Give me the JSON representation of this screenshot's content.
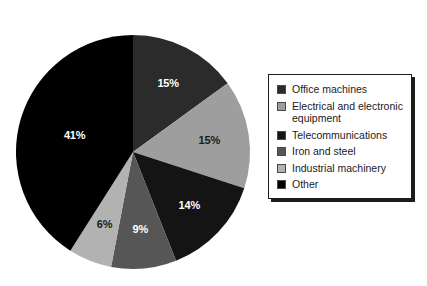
{
  "chart_data": {
    "type": "pie",
    "title": "",
    "subtitle": "",
    "xlabel": "",
    "ylabel": "",
    "grid": false,
    "legend_position": "right",
    "start_angle_deg": 0,
    "direction": "clockwise",
    "units": "%",
    "categories": [
      "Office machines",
      "Electrical and electronic equipment",
      "Telecommunications",
      "Iron and steel",
      "Industrial machinery",
      "Other"
    ],
    "values": [
      15,
      15,
      14,
      9,
      6,
      41
    ],
    "data_labels": [
      "15%",
      "15%",
      "14%",
      "9%",
      "6%",
      "41%"
    ],
    "colors": [
      "#2b2b2b",
      "#9e9e9e",
      "#141414",
      "#565656",
      "#b2b2b2",
      "#000000"
    ],
    "label_colors": [
      "#ffffff",
      "#1a1a1a",
      "#ffffff",
      "#ffffff",
      "#1a1a1a",
      "#ffffff"
    ]
  },
  "legend": {
    "items": [
      {
        "label": "Office machines",
        "color": "#2b2b2b"
      },
      {
        "label": "Electrical and electronic\nequipment",
        "color": "#9e9e9e"
      },
      {
        "label": "Telecommunications",
        "color": "#141414"
      },
      {
        "label": "Iron and steel",
        "color": "#565656"
      },
      {
        "label": "Industrial machinery",
        "color": "#b2b2b2"
      },
      {
        "label": "Other",
        "color": "#000000"
      }
    ]
  },
  "geometry": {
    "center_x": 133,
    "center_y": 152,
    "radius": 117
  }
}
